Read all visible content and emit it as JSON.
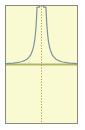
{
  "figure": {
    "name": "function-plot",
    "title": "",
    "background_color": "#ffffff",
    "width_px": 85,
    "height_px": 130
  },
  "plot": {
    "background_color": "#fafad2",
    "border_color": "#8a8a80",
    "border_width_px": 1,
    "left_px": 5,
    "top_px": 5,
    "width_px": 73,
    "height_px": 119
  },
  "axes": {
    "horizontal": {
      "label": "",
      "color": "#b3b369",
      "style": "solid",
      "width_px": 2,
      "y_fraction": 0.505
    },
    "vertical": {
      "label": "",
      "color": "#b3a14a",
      "style": "dotted",
      "width_px": 1,
      "x_fraction": 0.5
    }
  },
  "curve": {
    "color": "#7f9496",
    "width_px": 1.2,
    "style": "solid",
    "label": ""
  },
  "chart_data": {
    "type": "line",
    "title": "",
    "subtitle": "",
    "xlabel": "",
    "ylabel": "",
    "xlim": [
      -4,
      4
    ],
    "ylim": [
      -1.02,
      1.02
    ],
    "grid": false,
    "legend": null,
    "annotations": [
      {
        "text": "",
        "kind": "vertical-asymptote",
        "x": 0
      },
      {
        "text": "",
        "kind": "horizontal-axis",
        "y": 0
      }
    ],
    "xticks": [],
    "yticks": [],
    "series": [
      {
        "name": "y = 1/x^2 (clipped)",
        "x": [
          -4.0,
          -3.6,
          -3.2,
          -2.8,
          -2.4,
          -2.2,
          -2.0,
          -1.8,
          -1.6,
          -1.4,
          -1.2,
          -1.0,
          -0.9,
          -0.8,
          -0.7,
          -0.6,
          -0.5,
          -0.45,
          -0.4,
          -0.35,
          -0.32,
          -0.3,
          -0.28,
          -0.26,
          -0.25,
          0.25,
          0.26,
          0.28,
          0.3,
          0.32,
          0.35,
          0.4,
          0.45,
          0.5,
          0.6,
          0.7,
          0.8,
          0.9,
          1.0,
          1.2,
          1.4,
          1.6,
          1.8,
          2.0,
          2.2,
          2.4,
          2.8,
          3.2,
          3.6,
          4.0
        ],
        "y": [
          0.0156,
          0.0193,
          0.0244,
          0.0319,
          0.0434,
          0.0517,
          0.0625,
          0.0772,
          0.0977,
          0.1276,
          0.1736,
          0.25,
          0.3086,
          0.3906,
          0.5102,
          0.6944,
          1.0,
          1.0,
          1.0,
          1.0,
          1.0,
          1.0,
          1.0,
          1.0,
          1.0,
          1.0,
          1.0,
          1.0,
          1.0,
          1.0,
          1.0,
          1.0,
          1.0,
          1.0,
          0.6944,
          0.5102,
          0.3906,
          0.3086,
          0.25,
          0.1736,
          0.1276,
          0.0977,
          0.0772,
          0.0625,
          0.0517,
          0.0434,
          0.0319,
          0.0244,
          0.0193,
          0.0156
        ]
      }
    ]
  },
  "accessibility": {
    "description": "Symmetric curve with a vertical asymptote at x equals zero, approaching a horizontal axis on both sides."
  }
}
